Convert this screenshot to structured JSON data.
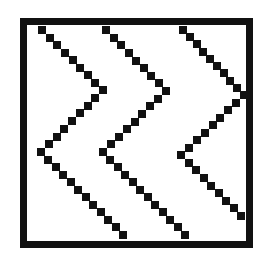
{
  "figure": {
    "background_color": "#ffffff",
    "ink_color": "#111111",
    "frame": {
      "left": 20,
      "top": 18,
      "right": 253,
      "bottom": 248,
      "thickness": 7
    },
    "dot_size": 8,
    "zigzags": [
      {
        "name": "zigzag-1",
        "points": [
          [
            42,
            30
          ],
          [
            103,
            90
          ],
          [
            41,
            152
          ],
          [
            123,
            235
          ]
        ]
      },
      {
        "name": "zigzag-2",
        "points": [
          [
            106,
            30
          ],
          [
            166,
            91
          ],
          [
            103,
            152
          ],
          [
            185,
            235
          ]
        ]
      },
      {
        "name": "zigzag-3",
        "points": [
          [
            183,
            30
          ],
          [
            244,
            95
          ],
          [
            181,
            155
          ],
          [
            241,
            216
          ]
        ]
      }
    ]
  }
}
